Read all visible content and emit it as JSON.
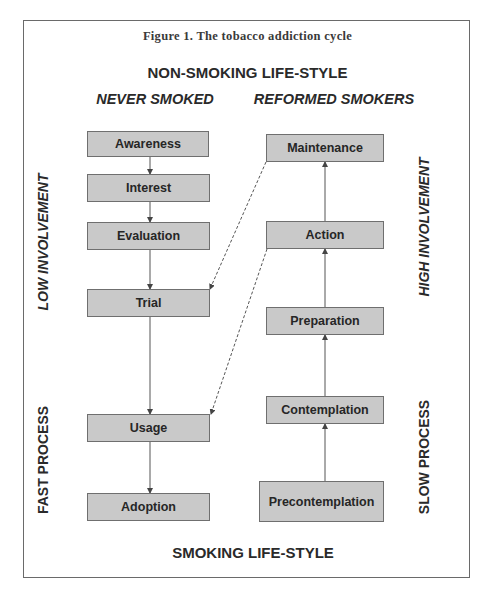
{
  "figure": {
    "title": "Figure 1. The tobacco addiction cycle",
    "top_label": "NON-SMOKING LIFE-STYLE",
    "bottom_label": "SMOKING LIFE-STYLE"
  },
  "columns": {
    "left_heading": "NEVER SMOKED",
    "right_heading": "REFORMED SMOKERS"
  },
  "side_labels": {
    "left_top": "LOW INVOLVEMENT",
    "left_bottom": "FAST PROCESS",
    "right_top": "HIGH INVOLVEMENT",
    "right_bottom": "SLOW PROCESS"
  },
  "left_stages": [
    {
      "label": "Awareness"
    },
    {
      "label": "Interest"
    },
    {
      "label": "Evaluation"
    },
    {
      "label": "Trial"
    },
    {
      "label": "Usage"
    },
    {
      "label": "Adoption"
    }
  ],
  "right_stages": [
    {
      "label": "Maintenance"
    },
    {
      "label": "Action"
    },
    {
      "label": "Preparation"
    },
    {
      "label": "Contemplation"
    },
    {
      "label": "Precontemplation"
    }
  ],
  "connections": {
    "solid_left": [
      "Awareness → Interest",
      "Interest → Evaluation",
      "Evaluation → Trial",
      "Trial → Usage",
      "Usage → Adoption"
    ],
    "solid_right": [
      "Precontemplation → Contemplation",
      "Contemplation → Preparation",
      "Preparation → Action",
      "Action → Maintenance"
    ],
    "dashed": [
      "Maintenance → Trial",
      "Action → Usage"
    ]
  },
  "colors": {
    "box_fill": "#c9c9c9",
    "box_border": "#6f6f6f",
    "line": "#555555",
    "text": "#262626"
  }
}
